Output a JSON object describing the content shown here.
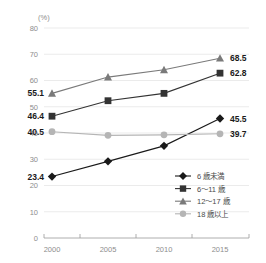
{
  "chart_data": {
    "type": "line",
    "title": "",
    "xlabel": "",
    "ylabel": "(%)",
    "categories": [
      "2000",
      "2005",
      "2010",
      "2015"
    ],
    "x": [
      2000,
      2005,
      2010,
      2015
    ],
    "ylim": [
      0,
      80
    ],
    "yticks": [
      0,
      10,
      20,
      30,
      40,
      50,
      60,
      70,
      80
    ],
    "ytick_labels": [
      "0",
      "10",
      "20",
      "30",
      "40",
      "50",
      "60",
      "70",
      "80"
    ],
    "grid": true,
    "legend_position": "bottom-right",
    "series": [
      {
        "name": "6 歳未満",
        "marker": "diamond",
        "color": "#1a1a1a",
        "values": [
          23.4,
          29.2,
          35.1,
          45.5
        ],
        "start_label": "23.4",
        "end_label": "45.5"
      },
      {
        "name": "6～11 歳",
        "marker": "square",
        "color": "#333333",
        "values": [
          46.4,
          52.3,
          55.1,
          62.8
        ],
        "start_label": "46.4",
        "end_label": "62.8"
      },
      {
        "name": "12～17 歳",
        "marker": "triangle",
        "color": "#7a7a7a",
        "values": [
          55.1,
          61.3,
          64.1,
          68.5
        ],
        "start_label": "55.1",
        "end_label": "68.5"
      },
      {
        "name": "18 歳以上",
        "marker": "circle",
        "color": "#b5b5b5",
        "values": [
          40.5,
          39.1,
          39.3,
          39.7
        ],
        "start_label": "40.5",
        "end_label": "39.7"
      }
    ]
  },
  "axis": {
    "unit_label": "(%)"
  },
  "colors": {
    "gridline": "#e2e2e2",
    "axis": "#9a9a9a",
    "tick_text": "#8d8d8d",
    "value_text": "#1a1a1a",
    "legend_text": "#4a4a4a"
  }
}
